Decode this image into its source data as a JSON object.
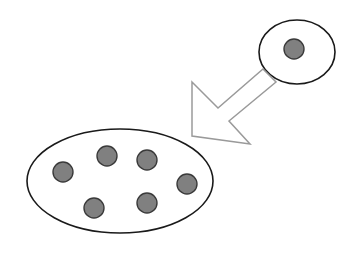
{
  "diagram": {
    "background_color": "#ffffff",
    "stroke_color": "#1a1a1a",
    "dot_fill_color": "#808080",
    "dot_stroke_color": "#3a3a3a",
    "arrow_stroke_color": "#9a9a9a",
    "arrow_fill_color": "#ffffff",
    "canvas": {
      "width": 356,
      "height": 254
    },
    "shapes": {
      "source_group": {
        "label": "source-ellipse",
        "cx": 297,
        "cy": 52,
        "rx": 38,
        "ry": 32,
        "member_count": 1,
        "members": [
          {
            "label": "dot-source-1",
            "cx": 294,
            "cy": 49,
            "r": 10
          }
        ]
      },
      "target_group": {
        "label": "target-ellipse",
        "cx": 120,
        "cy": 181,
        "rx": 93,
        "ry": 52,
        "member_count": 6,
        "members": [
          {
            "label": "dot-target-1",
            "cx": 63,
            "cy": 172,
            "r": 10
          },
          {
            "label": "dot-target-2",
            "cx": 107,
            "cy": 156,
            "r": 10
          },
          {
            "label": "dot-target-3",
            "cx": 147,
            "cy": 160,
            "r": 10
          },
          {
            "label": "dot-target-4",
            "cx": 187,
            "cy": 184,
            "r": 10
          },
          {
            "label": "dot-target-5",
            "cx": 147,
            "cy": 203,
            "r": 10
          },
          {
            "label": "dot-target-6",
            "cx": 94,
            "cy": 208,
            "r": 10
          }
        ]
      },
      "arrow": {
        "label": "block-arrow",
        "direction": "down-left",
        "from": "source-ellipse",
        "to": "target-ellipse",
        "points": "192,82 218,108 263,69 276,82 229,121 250,144 192,136"
      }
    }
  }
}
